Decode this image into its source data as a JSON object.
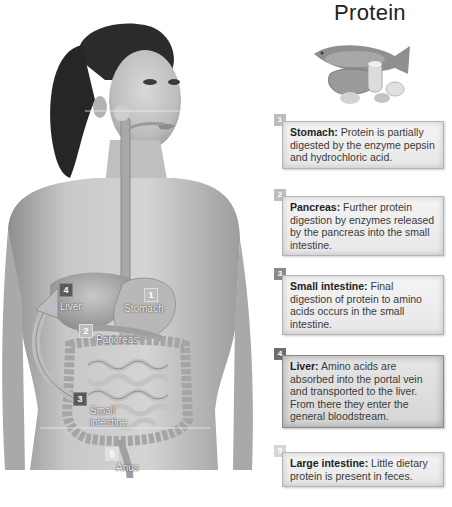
{
  "title": "Protein",
  "figure": {
    "labels": [
      {
        "number": "1",
        "name": "Stomach"
      },
      {
        "number": "2",
        "name": "Pancreas"
      },
      {
        "number": "3",
        "name": "Small\nintestine",
        "line1": "Small",
        "line2": "intestine"
      },
      {
        "number": "4",
        "name": "Liver"
      },
      {
        "number": "5",
        "name": "Anus"
      }
    ]
  },
  "food_icon": "protein-foods-illustration",
  "steps": [
    {
      "number": "1",
      "term": "Stomach:",
      "text": " Protein is partially digested by the enzyme pepsin and hydrochloric acid.",
      "badge_color": "#bdbdbd"
    },
    {
      "number": "2",
      "term": "Pancreas:",
      "text": " Further protein digestion by enzymes released by the pancreas into the small intestine.",
      "badge_color": "#bdbdbd"
    },
    {
      "number": "3",
      "term": "Small intestine:",
      "text": " Final digestion of protein to amino acids occurs in the small intestine.",
      "badge_color": "#6e6e6e"
    },
    {
      "number": "4",
      "term": "Liver:",
      "text": " Amino acids are absorbed into the portal vein and transported to the liver. From there they enter the general bloodstream.",
      "badge_color": "#6e6e6e"
    },
    {
      "number": "5",
      "term": "Large intestine:",
      "text": " Little dietary protein is present in feces.",
      "badge_color": "#d6d6d6"
    }
  ]
}
